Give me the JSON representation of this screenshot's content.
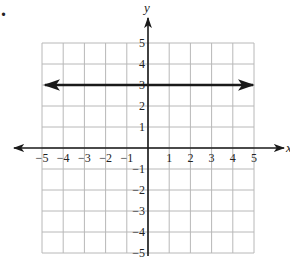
{
  "problem_marker": ".",
  "chart_data": {
    "type": "line",
    "title": "",
    "xlabel": "x",
    "ylabel": "y",
    "xlim": [
      -5,
      5
    ],
    "ylim": [
      -5,
      5
    ],
    "grid": true,
    "x_ticks": [
      "-5",
      "-4",
      "-3",
      "-2",
      "-1",
      "1",
      "2",
      "3",
      "4",
      "5"
    ],
    "y_ticks": [
      "5",
      "4",
      "3",
      "2",
      "1",
      "-1",
      "-2",
      "-3",
      "-4",
      "-5"
    ],
    "series": [
      {
        "name": "y = 3",
        "equation": "y = 3",
        "x": [
          -5,
          5
        ],
        "y": [
          3,
          3
        ],
        "arrows": "both ends"
      }
    ],
    "legend": "none"
  },
  "colors": {
    "grid": "#b8b8b8",
    "axis": "#1a1a1a",
    "line": "#1a1a1a",
    "background": "#ffffff"
  }
}
